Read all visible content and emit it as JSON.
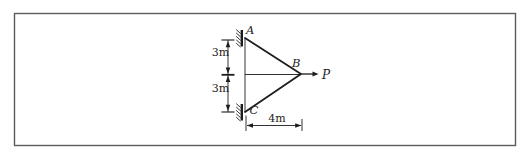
{
  "figure": {
    "kind": "statics-truss-diagram",
    "joints": {
      "top": "A",
      "right": "B",
      "bottom": "C"
    },
    "load_label": "P",
    "dimensions": {
      "upper_span": "3m",
      "lower_span": "3m",
      "base_span": "4m"
    },
    "colors": {
      "ink": "#1d1d1d",
      "frame_border": "#5c5c5c",
      "background": "#ffffff"
    }
  }
}
